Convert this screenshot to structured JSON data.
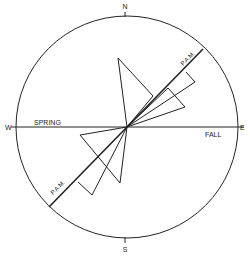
{
  "compass": {
    "north": "N",
    "south": "S",
    "west": "W",
    "east": "E"
  },
  "labels": {
    "spring": "SPRING",
    "fall": "FALL",
    "pam_upper": "P.A.M.",
    "pam_lower": "P.A.M."
  },
  "colors": {
    "ink": "#222222",
    "background": "#ffffff"
  }
}
